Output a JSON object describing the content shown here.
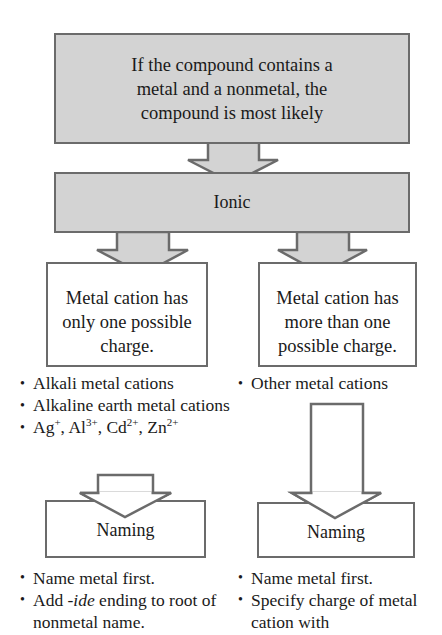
{
  "diagram": {
    "top_box": {
      "text": "If the compound contains a metal and a nonmetal, the compound is most likely"
    },
    "ionic_box": {
      "text": "Ionic"
    },
    "left_branch": {
      "condition": "Metal cation has only one possible charge.",
      "examples": [
        "Alkali metal cations",
        "Alkaline earth metal cations"
      ],
      "ion_list": {
        "ions": [
          {
            "symbol": "Ag",
            "charge": "+"
          },
          {
            "symbol": "Al",
            "charge": "3+"
          },
          {
            "symbol": "Cd",
            "charge": "2+"
          },
          {
            "symbol": "Zn",
            "charge": "2+"
          }
        ],
        "separator": ", "
      },
      "naming_box": {
        "text": "Naming"
      },
      "rules": {
        "rule1": "Name metal first.",
        "rule2_prefix": "Add ",
        "rule2_italic": "-ide",
        "rule2_suffix": " ending to root of nonmetal name."
      }
    },
    "right_branch": {
      "condition": "Metal cation has more than one possible charge.",
      "examples": [
        "Other metal cations"
      ],
      "naming_box": {
        "text": "Naming"
      },
      "rules": [
        "Name metal first.",
        "Specify charge of metal cation with"
      ]
    },
    "colors": {
      "shaded_fill": "#d3d3d3",
      "border": "#6b6b6b",
      "text": "#1a1a1a"
    }
  }
}
